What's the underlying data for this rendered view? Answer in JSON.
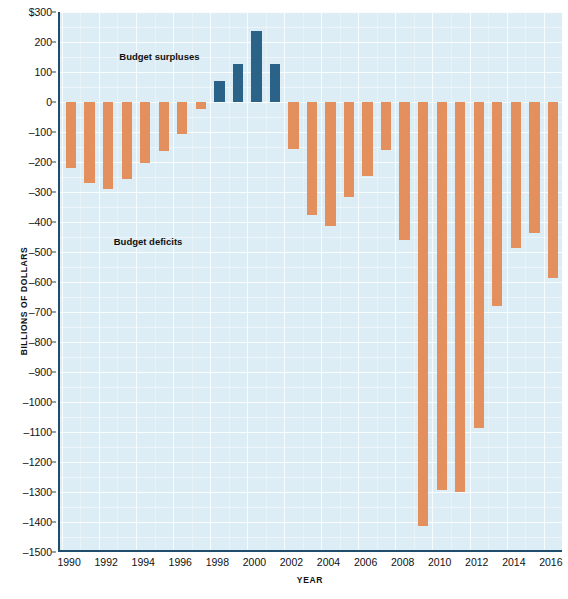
{
  "chart_data": {
    "type": "bar",
    "title": "",
    "xlabel": "YEAR",
    "ylabel": "BILLIONS OF DOLLARS",
    "ylim": [
      -1500,
      300
    ],
    "ytick_values": [
      300,
      200,
      100,
      0,
      -100,
      -200,
      -300,
      -400,
      -500,
      -600,
      -700,
      -800,
      -900,
      -1000,
      -1100,
      -1200,
      -1300,
      -1400,
      -1500
    ],
    "ytick_labels": [
      "$300",
      "200",
      "100",
      "0",
      "–100",
      "–200",
      "–300",
      "–400",
      "–500",
      "–600",
      "–700",
      "–800",
      "–900",
      "–1000",
      "–1100",
      "–1200",
      "–1300",
      "–1400",
      "–1500"
    ],
    "xlim": [
      1989.4,
      2016.6
    ],
    "xtick_values": [
      1990,
      1992,
      1994,
      1996,
      1998,
      2000,
      2002,
      2004,
      2006,
      2008,
      2010,
      2012,
      2014,
      2016
    ],
    "xtick_labels": [
      "1990",
      "1992",
      "1994",
      "1996",
      "1998",
      "2000",
      "2002",
      "2004",
      "2006",
      "2008",
      "2010",
      "2012",
      "2014",
      "2016"
    ],
    "grid": true,
    "legend_position": "none",
    "categories": [
      1990,
      1991,
      1992,
      1993,
      1994,
      1995,
      1996,
      1997,
      1998,
      1999,
      2000,
      2001,
      2002,
      2003,
      2004,
      2005,
      2006,
      2007,
      2008,
      2009,
      2010,
      2011,
      2012,
      2013,
      2014,
      2015,
      2016
    ],
    "values": [
      -221,
      -269,
      -290,
      -255,
      -203,
      -164,
      -107,
      -22,
      69,
      126,
      236,
      128,
      -158,
      -378,
      -413,
      -318,
      -248,
      -161,
      -459,
      -1413,
      -1294,
      -1300,
      -1087,
      -680,
      -485,
      -438,
      -585
    ],
    "series": [
      {
        "name": "Budget deficits",
        "color": "#e38f5e",
        "values": [
          -221,
          -269,
          -290,
          -255,
          -203,
          -164,
          -107,
          -22,
          null,
          null,
          null,
          null,
          -158,
          -378,
          -413,
          -318,
          -248,
          -161,
          -459,
          -1413,
          -1294,
          -1300,
          -1087,
          -680,
          -485,
          -438,
          -585
        ]
      },
      {
        "name": "Budget surpluses",
        "color": "#2a6288",
        "values": [
          null,
          null,
          null,
          null,
          null,
          null,
          null,
          null,
          69,
          126,
          236,
          128,
          null,
          null,
          null,
          null,
          null,
          null,
          null,
          null,
          null,
          null,
          null,
          null,
          null,
          null,
          null
        ]
      }
    ],
    "annotations": [
      {
        "text": "Budget surpluses",
        "x": 1992.6,
        "y": 150
      },
      {
        "text": "Budget deficits",
        "x": 1992.3,
        "y": -468
      }
    ]
  }
}
